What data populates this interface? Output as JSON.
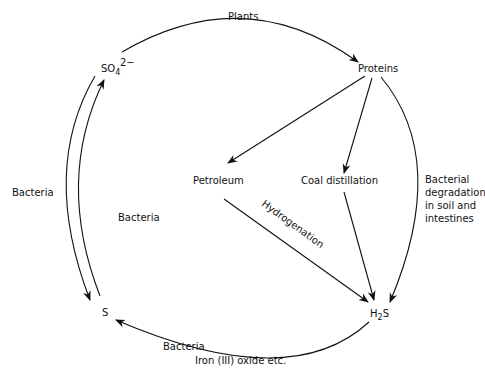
{
  "nodes": {
    "so4": {
      "label": "SO",
      "sub": "4",
      "sup": "2−"
    },
    "proteins": {
      "label": "Proteins"
    },
    "petroleum": {
      "label": "Petroleum"
    },
    "coal": {
      "label": "Coal distillation"
    },
    "h2s": {
      "label_h": "H",
      "sub": "2",
      "label_s": "S"
    },
    "s": {
      "label": "S"
    }
  },
  "edges": {
    "plants": {
      "label": "Plants"
    },
    "bacteria_left": {
      "label": "Bacteria"
    },
    "bacteria_center": {
      "label": "Bacteria"
    },
    "hydrogenation": {
      "label": "Hydrogenation"
    },
    "bacterial_degradation": {
      "lines": [
        "Bacterial",
        "degradation",
        "in soil and",
        "intestines"
      ]
    },
    "bacteria_bottom": {
      "label": "Bacteria"
    },
    "iron_oxide": {
      "label": "Iron (III) oxide etc."
    }
  },
  "colors": {
    "line": "#111111",
    "background": "#ffffff"
  }
}
